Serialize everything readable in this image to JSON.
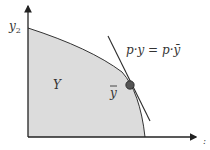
{
  "diagram": {
    "axes": {
      "y_label": "y",
      "y_label_sub": "2",
      "x_label": ":"
    },
    "set_label": "Y",
    "point_label": "y",
    "point_bar": "¯",
    "isoprofit_label": "p·y = p·ȳ",
    "colors": {
      "set_fill": "#dcdcdc",
      "axis": "#333333",
      "line": "#2b2b2b",
      "point": "#555555",
      "text": "#333333"
    }
  }
}
